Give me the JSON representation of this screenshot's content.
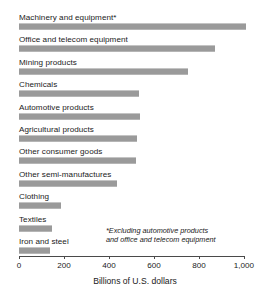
{
  "chart_data": {
    "type": "bar",
    "orientation": "horizontal",
    "title": "",
    "xlabel": "Billions of U.S. dollars",
    "ylabel": "",
    "xlim": [
      0,
      1000
    ],
    "xticks": [
      0,
      200,
      400,
      600,
      800,
      1000
    ],
    "xtick_labels": [
      "0",
      "200",
      "400",
      "600",
      "800",
      "1,000"
    ],
    "grid": false,
    "legend": false,
    "bar_color": "#9a9a9a",
    "axis_color": "#4a4a4a",
    "categories": [
      "Machinery and equipment*",
      "Office and telecom equipment",
      "Mining products",
      "Chemicals",
      "Automotive products",
      "Agricultural products",
      "Other consumer goods",
      "Other semi-manufactures",
      "Clothing",
      "Textiles",
      "Iron and steel"
    ],
    "values": [
      1010,
      870,
      750,
      532,
      537,
      524,
      519,
      435,
      185,
      145,
      136
    ],
    "annotations": [
      "*Excluding automotive products and office and telecom equipment"
    ]
  },
  "footnote": {
    "line1": "*Excluding automotive products",
    "line2": "and office and telecom equipment"
  }
}
